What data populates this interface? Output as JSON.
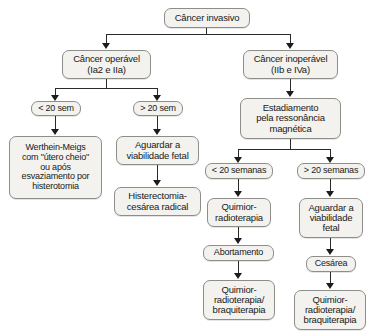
{
  "diagram": {
    "colors": {
      "node_fill": "#f3f2ee",
      "node_border": "#8d8d8a",
      "connector": "#2a2a2a",
      "text": "#1a1a1a",
      "background": "#ffffff"
    },
    "nodes": {
      "root": "Câncer invasivo",
      "operavel": "Câncer operável\n(Ia2 e IIa)",
      "inoperavel": "Câncer inoperável\n(IIb e IVa)",
      "lt20sem": "< 20 sem",
      "gt20sem": "> 20 sem",
      "werthein": "Werthein-Meigs\ncom \"útero cheio\"\nou após\nesvaziamento por\nhisterotomia",
      "aguardar_fetal_left": "Aguardar a\nviabilidade fetal",
      "histerectomia": "Histerectomia-\ncesárea radical",
      "estadiamento": "Estadiamento\npela ressonância\nmagnética",
      "lt20semanas": "< 20 semanas",
      "gt20semanas": "> 20 semanas",
      "quimio_radio": "Quimior-\nradioterapia",
      "abortamento": "Abortamento",
      "quimio_radio_braqui_left": "Quimior-\nradioterapia/\nbraquiterapia",
      "aguardar_fetal_right": "Aguardar a\nviabilidade\nfetal",
      "cesarea": "Cesárea",
      "quimio_radio_braqui_right": "Quimior-\nradioterapia/\nbraquiterapia"
    },
    "caption": ""
  }
}
